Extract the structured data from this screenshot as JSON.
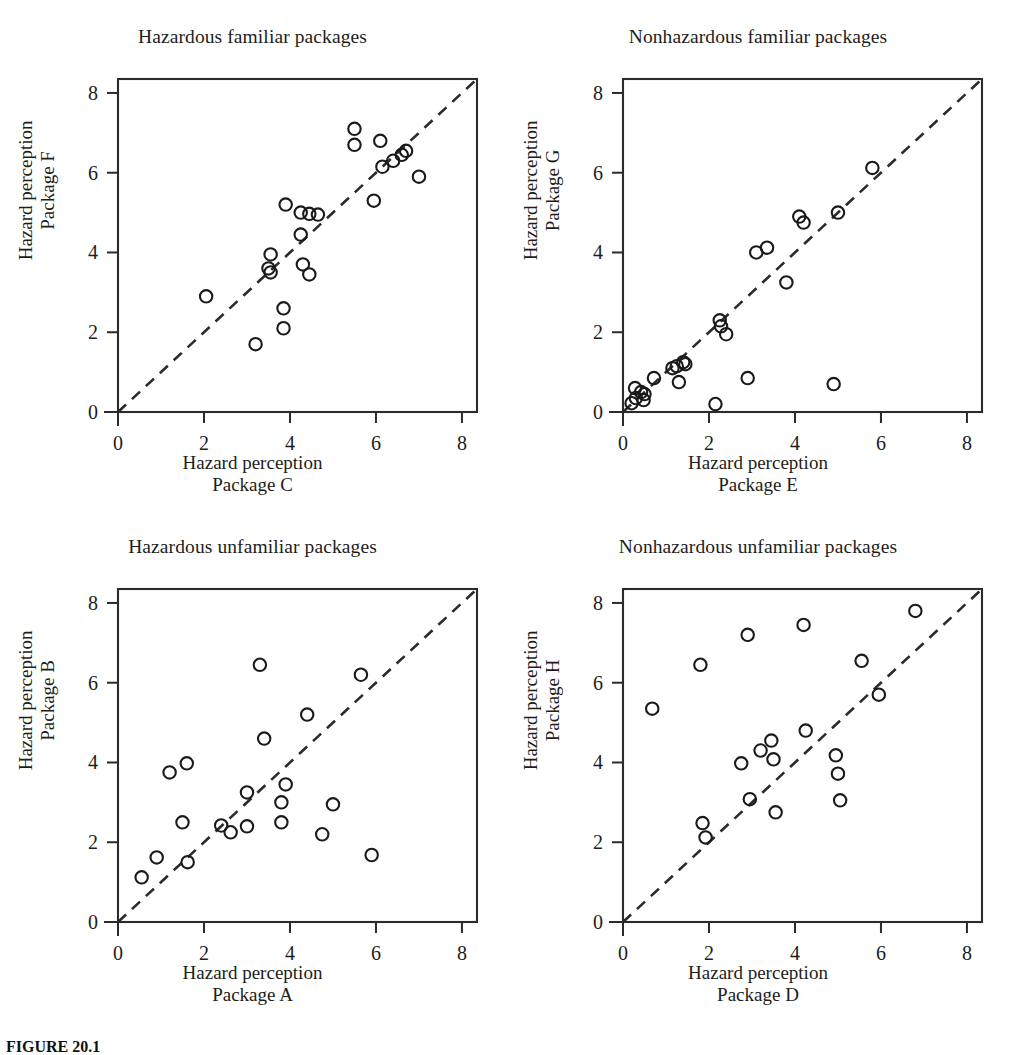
{
  "figure": {
    "caption_label": "FIGURE 20.1",
    "caption_text": "Scatterplots"
  },
  "axis": {
    "ticks": [
      0,
      2,
      4,
      6,
      8
    ],
    "min": 0,
    "max": 8,
    "frame_max": 8.35,
    "line_color": "#2b2b2b",
    "marker_color": "#1a1a1a",
    "reference_line_style": "dashed"
  },
  "panels": [
    {
      "id": "hazardous-familiar",
      "title": "Hazardous familiar packages",
      "x_caption_line1": "Hazard perception",
      "x_caption_line2": "Package C",
      "y_caption_line1": "Hazard perception",
      "y_caption_line2": "Package F"
    },
    {
      "id": "nonhazardous-familiar",
      "title": "Nonhazardous familiar packages",
      "x_caption_line1": "Hazard perception",
      "x_caption_line2": "Package E",
      "y_caption_line1": "Hazard perception",
      "y_caption_line2": "Package G"
    },
    {
      "id": "hazardous-unfamiliar",
      "title": "Hazardous unfamiliar packages",
      "x_caption_line1": "Hazard perception",
      "x_caption_line2": "Package A",
      "y_caption_line1": "Hazard perception",
      "y_caption_line2": "Package B"
    },
    {
      "id": "nonhazardous-unfamiliar",
      "title": "Nonhazardous unfamiliar packages",
      "x_caption_line1": "Hazard perception",
      "x_caption_line2": "Package D",
      "y_caption_line1": "Hazard perception",
      "y_caption_line2": "Package H"
    }
  ],
  "chart_data": [
    {
      "type": "scatter",
      "title": "Hazardous familiar packages",
      "xlabel": "Hazard perception Package C",
      "ylabel": "Hazard perception Package F",
      "xlim": [
        0,
        8
      ],
      "ylim": [
        0,
        8
      ],
      "xticks": [
        0,
        2,
        4,
        6,
        8
      ],
      "yticks": [
        0,
        2,
        4,
        6,
        8
      ],
      "grid": false,
      "legend": false,
      "reference_line": {
        "type": "identity",
        "from": [
          0,
          0
        ],
        "to": [
          8.35,
          8.35
        ],
        "style": "dashed"
      },
      "points": [
        {
          "x": 2.05,
          "y": 2.9
        },
        {
          "x": 3.2,
          "y": 1.7
        },
        {
          "x": 3.55,
          "y": 3.95
        },
        {
          "x": 3.5,
          "y": 3.6
        },
        {
          "x": 3.55,
          "y": 3.5
        },
        {
          "x": 3.85,
          "y": 2.6
        },
        {
          "x": 3.85,
          "y": 2.1
        },
        {
          "x": 3.9,
          "y": 5.2
        },
        {
          "x": 4.25,
          "y": 5.0
        },
        {
          "x": 4.45,
          "y": 4.97
        },
        {
          "x": 4.25,
          "y": 4.45
        },
        {
          "x": 4.3,
          "y": 3.7
        },
        {
          "x": 4.45,
          "y": 3.45
        },
        {
          "x": 4.65,
          "y": 4.95
        },
        {
          "x": 5.5,
          "y": 7.1
        },
        {
          "x": 5.5,
          "y": 6.7
        },
        {
          "x": 5.95,
          "y": 5.3
        },
        {
          "x": 6.1,
          "y": 6.8
        },
        {
          "x": 6.15,
          "y": 6.15
        },
        {
          "x": 6.4,
          "y": 6.3
        },
        {
          "x": 6.6,
          "y": 6.45
        },
        {
          "x": 6.7,
          "y": 6.55
        },
        {
          "x": 7.0,
          "y": 5.9
        }
      ]
    },
    {
      "type": "scatter",
      "title": "Nonhazardous familiar packages",
      "xlabel": "Hazard perception Package E",
      "ylabel": "Hazard perception Package G",
      "xlim": [
        0,
        8
      ],
      "ylim": [
        0,
        8
      ],
      "xticks": [
        0,
        2,
        4,
        6,
        8
      ],
      "yticks": [
        0,
        2,
        4,
        6,
        8
      ],
      "grid": false,
      "legend": false,
      "reference_line": {
        "type": "identity",
        "from": [
          0,
          0
        ],
        "to": [
          8.35,
          8.35
        ],
        "style": "dashed"
      },
      "points": [
        {
          "x": 0.2,
          "y": 0.22
        },
        {
          "x": 0.28,
          "y": 0.6
        },
        {
          "x": 0.3,
          "y": 0.35
        },
        {
          "x": 0.42,
          "y": 0.5
        },
        {
          "x": 0.5,
          "y": 0.45
        },
        {
          "x": 0.48,
          "y": 0.3
        },
        {
          "x": 0.72,
          "y": 0.85
        },
        {
          "x": 1.15,
          "y": 1.1
        },
        {
          "x": 1.25,
          "y": 1.15
        },
        {
          "x": 1.3,
          "y": 0.75
        },
        {
          "x": 1.4,
          "y": 1.25
        },
        {
          "x": 1.45,
          "y": 1.2
        },
        {
          "x": 2.15,
          "y": 0.2
        },
        {
          "x": 2.25,
          "y": 2.3
        },
        {
          "x": 2.28,
          "y": 2.15
        },
        {
          "x": 2.4,
          "y": 1.95
        },
        {
          "x": 2.9,
          "y": 0.85
        },
        {
          "x": 3.1,
          "y": 4.0
        },
        {
          "x": 3.35,
          "y": 4.12
        },
        {
          "x": 3.8,
          "y": 3.25
        },
        {
          "x": 4.1,
          "y": 4.9
        },
        {
          "x": 4.2,
          "y": 4.75
        },
        {
          "x": 4.9,
          "y": 0.7
        },
        {
          "x": 5.0,
          "y": 5.0
        },
        {
          "x": 5.8,
          "y": 6.12
        }
      ]
    },
    {
      "type": "scatter",
      "title": "Hazardous unfamiliar packages",
      "xlabel": "Hazard perception Package A",
      "ylabel": "Hazard perception Package B",
      "xlim": [
        0,
        8
      ],
      "ylim": [
        0,
        8
      ],
      "xticks": [
        0,
        2,
        4,
        6,
        8
      ],
      "yticks": [
        0,
        2,
        4,
        6,
        8
      ],
      "grid": false,
      "legend": false,
      "reference_line": {
        "type": "identity",
        "from": [
          0,
          0
        ],
        "to": [
          8.35,
          8.35
        ],
        "style": "dashed"
      },
      "points": [
        {
          "x": 0.55,
          "y": 1.12
        },
        {
          "x": 0.9,
          "y": 1.62
        },
        {
          "x": 1.2,
          "y": 3.75
        },
        {
          "x": 1.5,
          "y": 2.5
        },
        {
          "x": 1.62,
          "y": 1.5
        },
        {
          "x": 1.6,
          "y": 3.98
        },
        {
          "x": 2.4,
          "y": 2.42
        },
        {
          "x": 2.62,
          "y": 2.25
        },
        {
          "x": 3.0,
          "y": 3.25
        },
        {
          "x": 3.0,
          "y": 2.4
        },
        {
          "x": 3.3,
          "y": 6.45
        },
        {
          "x": 3.4,
          "y": 4.6
        },
        {
          "x": 3.8,
          "y": 3.0
        },
        {
          "x": 3.8,
          "y": 2.5
        },
        {
          "x": 3.9,
          "y": 3.45
        },
        {
          "x": 4.4,
          "y": 5.2
        },
        {
          "x": 4.75,
          "y": 2.2
        },
        {
          "x": 5.0,
          "y": 2.95
        },
        {
          "x": 5.65,
          "y": 6.2
        },
        {
          "x": 5.9,
          "y": 1.68
        }
      ]
    },
    {
      "type": "scatter",
      "title": "Nonhazardous unfamiliar packages",
      "xlabel": "Hazard perception Package D",
      "ylabel": "Hazard perception Package H",
      "xlim": [
        0,
        8
      ],
      "ylim": [
        0,
        8
      ],
      "xticks": [
        0,
        2,
        4,
        6,
        8
      ],
      "yticks": [
        0,
        2,
        4,
        6,
        8
      ],
      "grid": false,
      "legend": false,
      "reference_line": {
        "type": "identity",
        "from": [
          0,
          0
        ],
        "to": [
          8.35,
          8.35
        ],
        "style": "dashed"
      },
      "points": [
        {
          "x": 0.68,
          "y": 5.35
        },
        {
          "x": 1.8,
          "y": 6.45
        },
        {
          "x": 1.85,
          "y": 2.48
        },
        {
          "x": 1.92,
          "y": 2.12
        },
        {
          "x": 2.75,
          "y": 3.98
        },
        {
          "x": 2.9,
          "y": 7.2
        },
        {
          "x": 2.95,
          "y": 3.08
        },
        {
          "x": 3.2,
          "y": 4.3
        },
        {
          "x": 3.45,
          "y": 4.55
        },
        {
          "x": 3.5,
          "y": 4.08
        },
        {
          "x": 3.55,
          "y": 2.75
        },
        {
          "x": 4.2,
          "y": 7.45
        },
        {
          "x": 4.25,
          "y": 4.8
        },
        {
          "x": 4.95,
          "y": 4.18
        },
        {
          "x": 5.0,
          "y": 3.72
        },
        {
          "x": 5.05,
          "y": 3.05
        },
        {
          "x": 5.55,
          "y": 6.55
        },
        {
          "x": 5.95,
          "y": 5.7
        },
        {
          "x": 6.8,
          "y": 7.8
        }
      ]
    }
  ]
}
